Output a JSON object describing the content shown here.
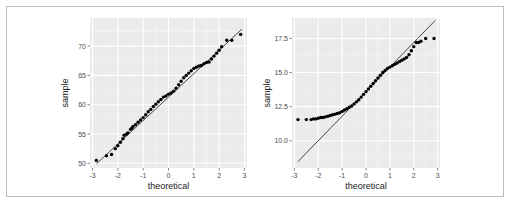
{
  "chart_data": [
    {
      "type": "scatter",
      "title": "",
      "xlabel": "theoretical",
      "ylabel": "sample",
      "xlim": [
        -3.1,
        3.1
      ],
      "ylim": [
        49.2,
        74.8
      ],
      "x_ticks": [
        -3,
        -2,
        -1,
        0,
        1,
        2,
        3
      ],
      "y_ticks": [
        50,
        55,
        60,
        65,
        70
      ],
      "y_tick_labels": [
        "50",
        "55",
        "60",
        "65",
        "70"
      ],
      "grid": true,
      "reference_line": {
        "slope": 4.0,
        "intercept": 61.3
      },
      "points": {
        "x": [
          -2.85,
          -2.45,
          -2.25,
          -2.1,
          -2.0,
          -1.9,
          -1.8,
          -1.75,
          -1.65,
          -1.6,
          -1.5,
          -1.45,
          -1.4,
          -1.3,
          -1.2,
          -1.1,
          -1.0,
          -0.9,
          -0.8,
          -0.7,
          -0.6,
          -0.5,
          -0.4,
          -0.3,
          -0.2,
          -0.1,
          0.0,
          0.1,
          0.2,
          0.3,
          0.4,
          0.5,
          0.6,
          0.7,
          0.8,
          0.9,
          1.0,
          1.1,
          1.2,
          1.3,
          1.4,
          1.5,
          1.6,
          1.7,
          1.8,
          1.9,
          2.0,
          2.1,
          2.3,
          2.5,
          2.85
        ],
        "y": [
          50.5,
          51.3,
          51.5,
          52.5,
          53.0,
          53.6,
          54.2,
          54.8,
          55.0,
          55.2,
          55.8,
          56.0,
          56.3,
          56.6,
          57.0,
          57.4,
          57.8,
          58.3,
          58.8,
          59.2,
          59.7,
          60.1,
          60.5,
          60.9,
          61.3,
          61.5,
          61.8,
          62.0,
          62.3,
          62.8,
          63.4,
          64.0,
          64.6,
          65.0,
          65.4,
          65.8,
          66.2,
          66.4,
          66.6,
          66.7,
          67.0,
          67.2,
          67.3,
          67.8,
          68.3,
          68.8,
          69.3,
          69.9,
          71.0,
          71.0,
          72.0
        ]
      }
    },
    {
      "type": "scatter",
      "title": "",
      "xlabel": "theoretical",
      "ylabel": "sample",
      "xlim": [
        -3.1,
        3.1
      ],
      "ylim": [
        8.0,
        19.0
      ],
      "x_ticks": [
        -3,
        -2,
        -1,
        0,
        1,
        2,
        3
      ],
      "y_ticks": [
        10.0,
        12.5,
        15.0,
        17.5
      ],
      "y_tick_labels": [
        "10.0",
        "12.5",
        "15.0",
        "17.5"
      ],
      "grid": true,
      "reference_line": {
        "slope": 1.8,
        "intercept": 13.6
      },
      "points": {
        "x": [
          -2.85,
          -2.5,
          -2.3,
          -2.2,
          -2.1,
          -2.0,
          -1.9,
          -1.8,
          -1.7,
          -1.6,
          -1.5,
          -1.4,
          -1.3,
          -1.2,
          -1.1,
          -1.0,
          -0.9,
          -0.8,
          -0.7,
          -0.6,
          -0.5,
          -0.4,
          -0.3,
          -0.2,
          -0.1,
          0.0,
          0.1,
          0.2,
          0.3,
          0.4,
          0.5,
          0.6,
          0.7,
          0.8,
          0.9,
          1.0,
          1.1,
          1.2,
          1.3,
          1.4,
          1.5,
          1.6,
          1.7,
          1.8,
          1.9,
          2.0,
          2.1,
          2.2,
          2.3,
          2.5,
          2.85
        ],
        "y": [
          11.55,
          11.55,
          11.55,
          11.6,
          11.6,
          11.65,
          11.7,
          11.7,
          11.75,
          11.8,
          11.85,
          11.9,
          11.95,
          12.0,
          12.05,
          12.15,
          12.25,
          12.35,
          12.45,
          12.55,
          12.7,
          12.85,
          13.0,
          13.2,
          13.4,
          13.6,
          13.8,
          14.0,
          14.2,
          14.4,
          14.6,
          14.8,
          15.0,
          15.15,
          15.3,
          15.4,
          15.5,
          15.6,
          15.7,
          15.8,
          15.9,
          16.0,
          16.1,
          16.3,
          16.6,
          16.9,
          17.2,
          17.2,
          17.3,
          17.5,
          17.5
        ]
      }
    }
  ]
}
